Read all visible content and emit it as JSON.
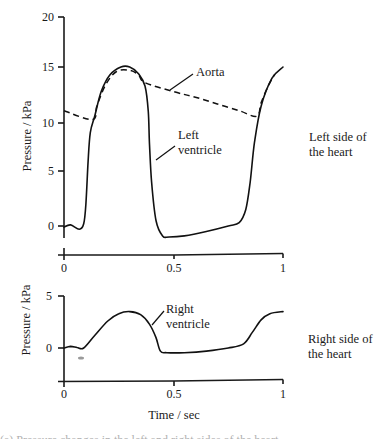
{
  "chart_data": [
    {
      "type": "line",
      "panel": "upper",
      "side_label": [
        "Left side of",
        "the heart"
      ],
      "xlabel": "",
      "ylabel": "Pressure / kPa",
      "xlim": [
        0,
        1
      ],
      "ylim": [
        -1.5,
        20
      ],
      "x_ticks": [
        "0",
        "0.5",
        "1"
      ],
      "y_ticks": [
        "0",
        "5",
        "10",
        "15",
        "20"
      ],
      "grid": false,
      "series": [
        {
          "name": "Left ventricle",
          "style": "solid",
          "x": [
            0,
            0.03,
            0.07,
            0.09,
            0.1,
            0.11,
            0.12,
            0.14,
            0.17,
            0.21,
            0.26,
            0.3,
            0.34,
            0.37,
            0.385,
            0.39,
            0.4,
            0.42,
            0.45,
            0.48,
            0.55,
            0.65,
            0.75,
            0.8,
            0.83,
            0.85,
            0.87,
            0.9,
            0.95,
            1.0
          ],
          "y": [
            -0.1,
            0.1,
            -0.3,
            0.2,
            2,
            6,
            9,
            10.6,
            12.8,
            14.3,
            15.0,
            15.0,
            14.4,
            13.3,
            11,
            8,
            4,
            0.5,
            -0.9,
            -1.0,
            -0.9,
            -0.5,
            0.0,
            0.3,
            1.5,
            4,
            8,
            11.5,
            14,
            15
          ]
        },
        {
          "name": "Aorta",
          "style": "dashed",
          "x": [
            0,
            0.13,
            0.15,
            0.19,
            0.24,
            0.3,
            0.34,
            0.37,
            0.5,
            0.6,
            0.7,
            0.8,
            0.88,
            0.9,
            0.93,
            0.96
          ],
          "y": [
            11.1,
            10.3,
            11.5,
            13.4,
            14.6,
            14.7,
            14.3,
            13.6,
            12.8,
            12.3,
            11.7,
            11.1,
            10.6,
            11.8,
            13.2,
            14.3
          ]
        }
      ],
      "annotations": [
        {
          "text": "Aorta",
          "target_series": "Aorta"
        },
        {
          "text": "Left ventricle",
          "target_series": "Left ventricle"
        }
      ]
    },
    {
      "type": "line",
      "panel": "lower",
      "side_label": [
        "Right side of",
        "the heart"
      ],
      "xlabel": "Time / sec",
      "ylabel": "Pressure / kPa",
      "xlim": [
        0,
        1
      ],
      "ylim": [
        -3.2,
        5
      ],
      "x_ticks": [
        "0",
        "0.5",
        "1"
      ],
      "y_ticks": [
        "0",
        "5"
      ],
      "grid": false,
      "series": [
        {
          "name": "Right ventricle",
          "style": "solid",
          "x": [
            0,
            0.03,
            0.06,
            0.09,
            0.14,
            0.2,
            0.25,
            0.3,
            0.35,
            0.39,
            0.42,
            0.44,
            0.47,
            0.55,
            0.65,
            0.75,
            0.82,
            0.86,
            0.9,
            0.94,
            1.0
          ],
          "y": [
            0.0,
            0.15,
            0.05,
            0.0,
            1.2,
            2.6,
            3.3,
            3.5,
            3.2,
            2.3,
            1.0,
            -0.3,
            -0.45,
            -0.45,
            -0.3,
            0.0,
            0.4,
            1.5,
            2.7,
            3.3,
            3.5
          ]
        }
      ],
      "annotations": [
        {
          "text": "Right ventricle",
          "target_series": "Right ventricle"
        }
      ]
    }
  ],
  "labels": {
    "upper": {
      "ylabel": "Pressure / kPa",
      "yticks": [
        "20",
        "15",
        "10",
        "5",
        "0"
      ],
      "xticks": [
        "0",
        "0.5",
        "1"
      ],
      "aorta": "Aorta",
      "lv_line1": "Left",
      "lv_line2": "ventricle",
      "side1": "Left side of",
      "side2": "the heart"
    },
    "lower": {
      "ylabel": "Pressure / kPa",
      "yticks": [
        "5",
        "0"
      ],
      "xticks": [
        "0",
        "0.5",
        "1"
      ],
      "rv_line1": "Right",
      "rv_line2": "ventricle",
      "side1": "Right side of",
      "side2": "the heart",
      "xlabel": "Time / sec"
    }
  },
  "caption_partial": "(a) Pressure changes in the left and right sides of the heart"
}
